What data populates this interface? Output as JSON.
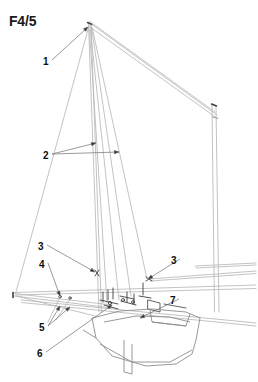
{
  "figure": {
    "title": "F4/5",
    "background_color": "#ffffff",
    "line_color_rigging": "#b4b4b4",
    "line_color_hull": "#8c8c8c",
    "line_color_fittings": "#3c3c3c",
    "leader_color": "#6e6e6e",
    "label_color": "#0d0d0d"
  },
  "callouts": [
    {
      "id": "1",
      "label": "1",
      "x": 44,
      "y": 63,
      "targets": [
        [
          88,
          27
        ]
      ]
    },
    {
      "id": "2",
      "label": "2",
      "x": 44,
      "y": 157,
      "targets": [
        [
          96,
          143
        ],
        [
          119,
          152
        ]
      ]
    },
    {
      "id": "3a",
      "label": "3",
      "x": 39,
      "y": 248,
      "targets": [
        [
          95,
          272
        ]
      ]
    },
    {
      "id": "4",
      "label": "4",
      "x": 40,
      "y": 266,
      "targets": [
        [
          60,
          296
        ]
      ]
    },
    {
      "id": "3b",
      "label": "3",
      "x": 172,
      "y": 262,
      "targets": [
        [
          148,
          279
        ]
      ]
    },
    {
      "id": "5",
      "label": "5",
      "x": 40,
      "y": 329,
      "targets": [
        [
          60,
          306
        ],
        [
          70,
          307
        ]
      ]
    },
    {
      "id": "6",
      "label": "6",
      "x": 38,
      "y": 355,
      "targets": [
        [
          112,
          305
        ]
      ]
    },
    {
      "id": "7",
      "label": "7",
      "x": 171,
      "y": 302,
      "targets": [
        [
          140,
          318
        ]
      ]
    }
  ],
  "structure": {
    "main_mast": {
      "head": [
        88,
        24
      ],
      "heel": [
        100,
        312
      ]
    },
    "mizzen_mast": {
      "head": [
        213,
        105
      ],
      "heel": [
        216,
        312
      ]
    },
    "gaff": {
      "from": [
        90,
        22
      ],
      "to": [
        216,
        113
      ]
    },
    "bowsprit": {
      "tip": [
        14,
        294
      ],
      "root": [
        112,
        306
      ]
    },
    "spars": [
      {
        "name": "upper-spar",
        "from": [
          16,
          292
        ],
        "to": [
          256,
          286
        ]
      },
      {
        "name": "lower-spar",
        "from": [
          20,
          300
        ],
        "to": [
          256,
          324
        ]
      }
    ]
  }
}
